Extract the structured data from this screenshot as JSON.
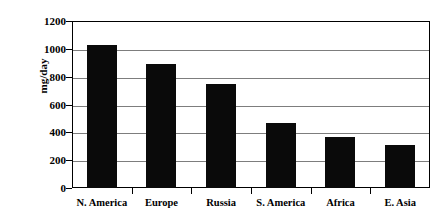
{
  "chart_data": {
    "type": "bar",
    "title": "",
    "xlabel": "",
    "ylabel": "mg/day",
    "categories": [
      "N. America",
      "Europe",
      "Russia",
      "S. America",
      "Africa",
      "E. Asia"
    ],
    "values": [
      1030,
      890,
      750,
      470,
      370,
      310
    ],
    "ylim": [
      0,
      1200
    ],
    "ytick_labels": [
      "1200",
      "1000",
      "800",
      "600",
      "400",
      "200",
      "0"
    ],
    "ytick_values": [
      1200,
      1000,
      800,
      600,
      400,
      200,
      0
    ],
    "grid": "horizontal",
    "legend": "none",
    "bar_color": "#0a0a0a",
    "gridline_color": "#7d7d7d",
    "axis_color": "#000000",
    "background_color": "#ffffff"
  }
}
